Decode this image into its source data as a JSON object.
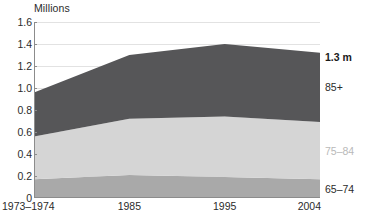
{
  "chart_data": {
    "type": "area",
    "title": "",
    "subtitle": "",
    "ylabel": "Millions",
    "xlabel": "",
    "stacked": true,
    "grid": true,
    "legend_position": "right-inline",
    "categories": [
      "1973–1974",
      "1985",
      "1995",
      "2004"
    ],
    "x_positions": [
      0,
      1,
      2,
      3
    ],
    "ylim": [
      0,
      1.6
    ],
    "yticks": [
      "0",
      "0.2",
      "0.4",
      "0.6",
      "0.8",
      "1.0",
      "1.2",
      "1.4",
      "1.6"
    ],
    "ytick_values": [
      0,
      0.2,
      0.4,
      0.6,
      0.8,
      1.0,
      1.2,
      1.4,
      1.6
    ],
    "series": [
      {
        "name": "65–74",
        "label": "65–74",
        "color": "#a9a9a9",
        "label_color": "#2b2b2b",
        "values": [
          0.17,
          0.21,
          0.19,
          0.17
        ]
      },
      {
        "name": "75–84",
        "label": "75–84",
        "color": "#d5d5d5",
        "label_color": "#b9b9b9",
        "values": [
          0.39,
          0.51,
          0.55,
          0.52
        ]
      },
      {
        "name": "85+",
        "label": "85+",
        "color": "#565658",
        "label_color": "#2b2b2b",
        "values": [
          0.4,
          0.58,
          0.66,
          0.63
        ]
      }
    ],
    "totals": [
      0.96,
      1.3,
      1.4,
      1.32
    ],
    "annotations": [
      {
        "text": "1.3 m",
        "value": 1.32,
        "bold": true,
        "color": "#1a1a1a"
      }
    ]
  },
  "colors": {
    "background": "#ffffff",
    "axis": "#8c8c8c",
    "grid": "#e2e2e2",
    "text": "#2b2b2b"
  }
}
